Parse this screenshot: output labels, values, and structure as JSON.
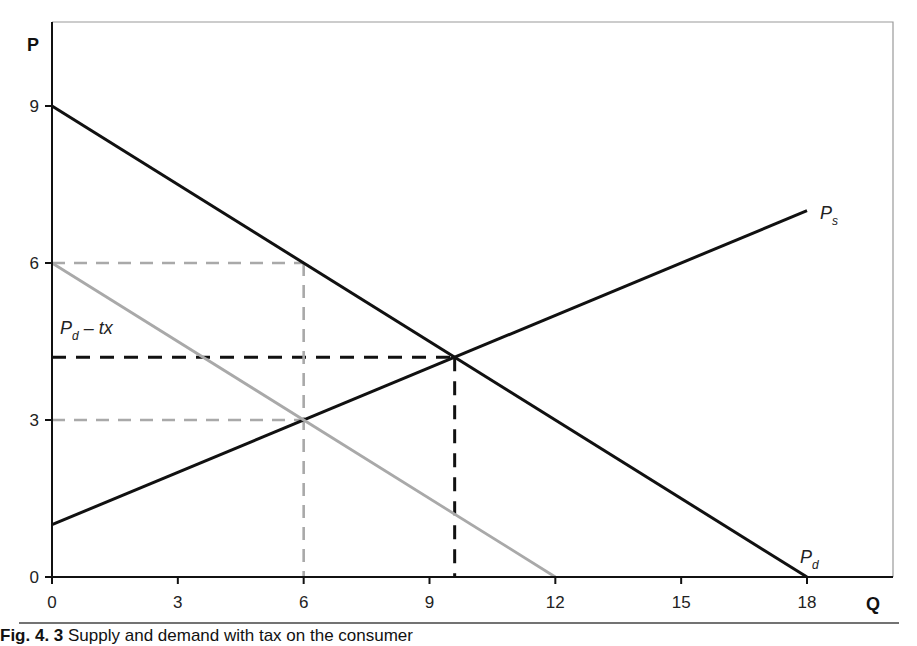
{
  "figure": {
    "caption_label": "Fig. 4. 3",
    "caption_text": "Supply and demand with tax on the consumer"
  },
  "colors": {
    "black_line": "#111111",
    "gray_line": "#a9a9a9",
    "frame": "#9a9a9a"
  },
  "chart_data": {
    "type": "line",
    "title": "",
    "xlabel": "Q",
    "ylabel": "P",
    "xlim": [
      0,
      18.7
    ],
    "ylim": [
      0,
      10.5
    ],
    "x_ticks": [
      0,
      3,
      6,
      9,
      12,
      15,
      18
    ],
    "y_ticks": [
      0,
      3,
      6,
      9
    ],
    "grid": false,
    "series": [
      {
        "name": "P_d",
        "label_main": "P",
        "label_sub": "d",
        "style": "solid",
        "color": "black",
        "points": [
          [
            0,
            9
          ],
          [
            18,
            0
          ]
        ]
      },
      {
        "name": "P_s",
        "label_main": "P",
        "label_sub": "s",
        "style": "solid",
        "color": "black",
        "points": [
          [
            0,
            1
          ],
          [
            18,
            7
          ]
        ]
      },
      {
        "name": "P_d - tx",
        "label_main": "P",
        "label_sub": "d",
        "label_suffix": " – tx",
        "style": "solid",
        "color": "gray",
        "points": [
          [
            0,
            6
          ],
          [
            12,
            0
          ]
        ]
      }
    ],
    "reference_lines": [
      {
        "name": "equilibrium-price",
        "style": "dashed",
        "color": "black",
        "points": [
          [
            0,
            4.2
          ],
          [
            9.6,
            4.2
          ]
        ]
      },
      {
        "name": "equilibrium-quantity",
        "style": "dashed",
        "color": "black",
        "points": [
          [
            9.6,
            4.2
          ],
          [
            9.6,
            0
          ]
        ]
      },
      {
        "name": "buyer-price",
        "style": "dashed",
        "color": "gray",
        "points": [
          [
            0,
            6
          ],
          [
            6,
            6
          ]
        ]
      },
      {
        "name": "seller-price",
        "style": "dashed",
        "color": "gray",
        "points": [
          [
            0,
            3
          ],
          [
            6,
            3
          ]
        ]
      },
      {
        "name": "taxed-quantity",
        "style": "dashed",
        "color": "gray",
        "points": [
          [
            6,
            6
          ],
          [
            6,
            0
          ]
        ]
      }
    ],
    "annotations": {
      "equilibrium_no_tax": {
        "Q": 9.6,
        "P": 4.2
      },
      "equilibrium_with_tax": {
        "Q": 6,
        "P_buyer": 6,
        "P_seller": 3
      }
    }
  }
}
